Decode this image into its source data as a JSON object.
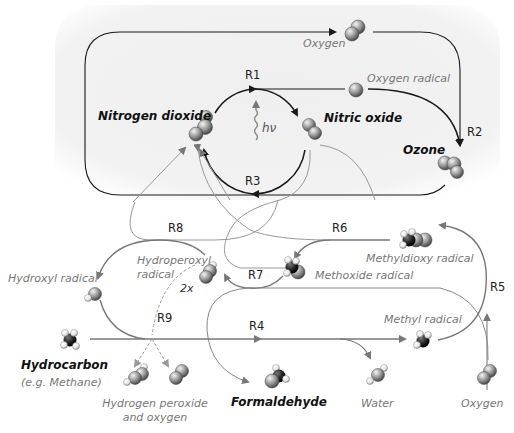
{
  "diagram": {
    "colors": {
      "background_panel": "#f3f3f3",
      "primary_arrow": "#1a1a1a",
      "secondary_arrow": "#8a8a8a",
      "label_gray": "#777777",
      "label_dark": "#111111"
    },
    "reactions": {
      "r1": "R1",
      "r2": "R2",
      "r3": "R3",
      "r4": "R4",
      "r5": "R5",
      "r6": "R6",
      "r7": "R7",
      "r8": "R8",
      "r9": "R9"
    },
    "light": {
      "symbol": "hν",
      "icon": "photon-wave-icon"
    },
    "multiplier": "2x",
    "species": {
      "oxygen_top": "Oxygen",
      "oxygen_radical": "Oxygen radical",
      "nitrogen_dioxide": "Nitrogen dioxide",
      "nitric_oxide": "Nitric oxide",
      "ozone": "Ozone",
      "hydroxyl_radical": "Hydroxyl radical",
      "hydroperoxyl_radical_line1": "Hydroperoxyl",
      "hydroperoxyl_radical_line2": "radical",
      "methyldioxy_radical": "Methyldioxy radical",
      "methoxide_radical": "Methoxide radical",
      "methyl_radical": "Methyl radical",
      "hydrocarbon": "Hydrocarbon",
      "hydrocarbon_example": "(e.g. Methane)",
      "hydrogen_peroxide_line1": "Hydrogen peroxide",
      "hydrogen_peroxide_line2": "and oxygen",
      "formaldehyde": "Formaldehyde",
      "water": "Water",
      "oxygen_bottom": "Oxygen"
    }
  }
}
